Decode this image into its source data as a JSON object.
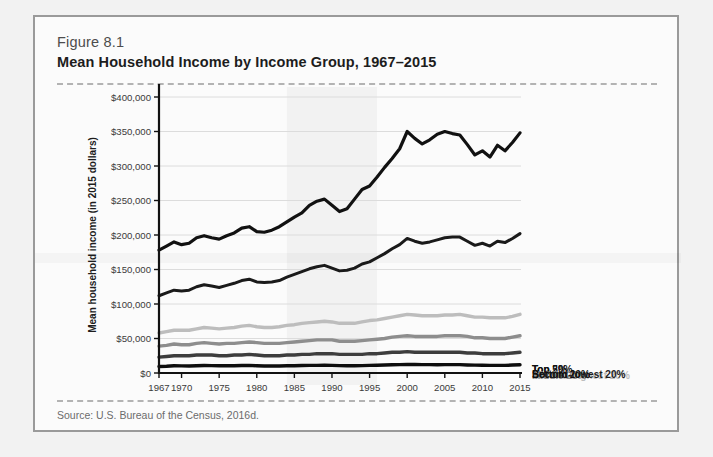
{
  "figure": {
    "number": "Figure 8.1",
    "title": "Mean Household Income by Income Group, 1967–2015",
    "source": "Source: U.S. Bureau of the Census, 2016d."
  },
  "chart_data": {
    "type": "line",
    "title": "Mean Household Income by Income Group, 1967–2015",
    "xlabel": "",
    "ylabel": "Mean household income (in 2015 dollars)",
    "xlim": [
      1967,
      2015
    ],
    "ylim": [
      0,
      400000
    ],
    "grid": true,
    "legend_position": "right-inline",
    "y_ticks": [
      "$0",
      "$50,000",
      "$100,000",
      "$150,000",
      "$200,000",
      "$250,000",
      "$300,000",
      "$350,000",
      "$400,000"
    ],
    "y_tick_values": [
      0,
      50000,
      100000,
      150000,
      200000,
      250000,
      300000,
      350000,
      400000
    ],
    "x_ticks": [
      "1967",
      "1970",
      "1975",
      "1980",
      "1985",
      "1990",
      "1995",
      "2000",
      "2005",
      "2010",
      "2015"
    ],
    "x_tick_values": [
      1967,
      1970,
      1975,
      1980,
      1985,
      1990,
      1995,
      2000,
      2005,
      2010,
      2015
    ],
    "x": [
      1967,
      1968,
      1969,
      1970,
      1971,
      1972,
      1973,
      1974,
      1975,
      1976,
      1977,
      1978,
      1979,
      1980,
      1981,
      1982,
      1983,
      1984,
      1985,
      1986,
      1987,
      1988,
      1989,
      1990,
      1991,
      1992,
      1993,
      1994,
      1995,
      1996,
      1997,
      1998,
      1999,
      2000,
      2001,
      2002,
      2003,
      2004,
      2005,
      2006,
      2007,
      2008,
      2009,
      2010,
      2011,
      2012,
      2013,
      2014,
      2015
    ],
    "series": [
      {
        "name": "Top 5%",
        "color": "#111111",
        "width": 3.2,
        "label_color": "#111111",
        "values": [
          178000,
          184000,
          190000,
          186000,
          188000,
          196000,
          199000,
          196000,
          194000,
          199000,
          203000,
          210000,
          212000,
          205000,
          204000,
          207000,
          212000,
          219000,
          226000,
          232000,
          243000,
          249000,
          252000,
          243000,
          234000,
          238000,
          252000,
          266000,
          271000,
          284000,
          298000,
          311000,
          325000,
          350000,
          340000,
          332000,
          338000,
          346000,
          350000,
          347000,
          345000,
          331000,
          316000,
          322000,
          313000,
          330000,
          322000,
          334000,
          348000
        ]
      },
      {
        "name": "Top 20%",
        "color": "#1a1a1a",
        "width": 3.0,
        "label_color": "#111111",
        "values": [
          112000,
          116000,
          120000,
          119000,
          120000,
          125000,
          128000,
          126000,
          124000,
          127000,
          130000,
          134000,
          136000,
          132000,
          131000,
          132000,
          134000,
          139000,
          143000,
          147000,
          151000,
          154000,
          156000,
          152000,
          148000,
          149000,
          152000,
          158000,
          161000,
          167000,
          173000,
          180000,
          186000,
          195000,
          191000,
          188000,
          190000,
          193000,
          196000,
          197000,
          197000,
          191000,
          185000,
          188000,
          184000,
          191000,
          189000,
          195000,
          202000
        ]
      },
      {
        "name": "Second-highest 20%",
        "color": "#bdbdbd",
        "width": 3.4,
        "label_color": "#bdbdbd",
        "values": [
          58000,
          60000,
          62000,
          62000,
          62000,
          64000,
          66000,
          65000,
          64000,
          65000,
          66000,
          68000,
          69000,
          67000,
          66000,
          66000,
          67000,
          69000,
          70000,
          72000,
          73000,
          74000,
          75000,
          74000,
          72000,
          72000,
          72000,
          74000,
          76000,
          77000,
          79000,
          81000,
          83000,
          85000,
          84000,
          83000,
          83000,
          83000,
          84000,
          84000,
          85000,
          83000,
          81000,
          81000,
          80000,
          80000,
          80000,
          82000,
          85000
        ]
      },
      {
        "name": "Middle 20%",
        "color": "#8d8d8d",
        "width": 3.4,
        "label_color": "#8d8d8d",
        "values": [
          39000,
          40000,
          42000,
          41000,
          41000,
          43000,
          44000,
          43000,
          42000,
          43000,
          43000,
          44000,
          45000,
          44000,
          43000,
          43000,
          43000,
          44000,
          45000,
          46000,
          47000,
          48000,
          48000,
          48000,
          46000,
          46000,
          46000,
          47000,
          48000,
          49000,
          50000,
          52000,
          53000,
          54000,
          53000,
          53000,
          53000,
          53000,
          54000,
          54000,
          54000,
          53000,
          51000,
          51000,
          50000,
          50000,
          50000,
          52000,
          54000
        ]
      },
      {
        "name": "Second-lowest 20%",
        "color": "#3d3d3d",
        "width": 3.4,
        "label_color": "#1d1d1d",
        "values": [
          23000,
          24000,
          25000,
          25000,
          25000,
          26000,
          26000,
          26000,
          25000,
          25000,
          26000,
          26000,
          27000,
          26000,
          25000,
          25000,
          25000,
          26000,
          26000,
          27000,
          27000,
          28000,
          28000,
          28000,
          27000,
          27000,
          27000,
          27000,
          28000,
          28000,
          29000,
          30000,
          30000,
          31000,
          30000,
          30000,
          30000,
          30000,
          30000,
          30000,
          30000,
          29000,
          29000,
          28000,
          28000,
          28000,
          28000,
          29000,
          30000
        ]
      },
      {
        "name": "Bottom 20%",
        "color": "#0d0d0d",
        "width": 3.4,
        "label_color": "#111111",
        "values": [
          9500,
          9800,
          10400,
          10300,
          10200,
          10600,
          10900,
          10700,
          10400,
          10500,
          10600,
          10800,
          11000,
          10500,
          10200,
          10100,
          10100,
          10400,
          10500,
          10800,
          11000,
          11100,
          11300,
          11100,
          10700,
          10600,
          10500,
          10700,
          11000,
          11200,
          11500,
          11900,
          12200,
          12500,
          12300,
          12100,
          12100,
          12000,
          12100,
          12100,
          12100,
          11700,
          11400,
          11300,
          11100,
          11100,
          11000,
          11500,
          12000
        ]
      }
    ]
  }
}
